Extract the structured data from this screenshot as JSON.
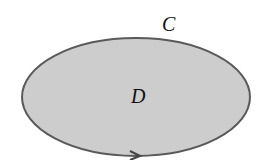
{
  "diagram": {
    "region_label": "D",
    "curve_label": "C",
    "colors": {
      "fill": "#cdcdcd",
      "stroke": "#555555",
      "label": "#111111"
    },
    "orientation": "counterclockwise arrow at bottom"
  }
}
